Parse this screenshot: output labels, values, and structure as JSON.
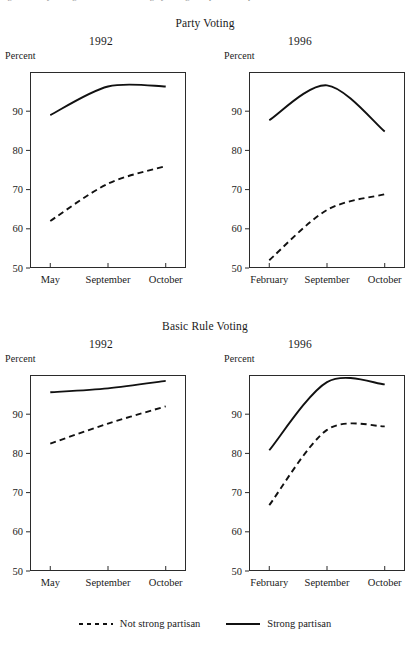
{
  "figure": {
    "caption_sliver": "Figure 1  Party voting and basic rule voting by strength of partisanship",
    "percent_axis_label": "Percent",
    "sections": [
      {
        "title": "Party Voting"
      },
      {
        "title": "Basic Rule Voting"
      }
    ]
  },
  "legend": {
    "position": "bottom-center",
    "items": [
      {
        "label": "Not strong partisan",
        "style": "dashed",
        "color": "#111111"
      },
      {
        "label": "Strong partisan",
        "style": "solid",
        "color": "#111111"
      }
    ]
  },
  "chart_data": [
    {
      "type": "line",
      "title": "Party Voting",
      "subtitle": "1992",
      "xlabel": "",
      "ylabel": "Percent",
      "categories": [
        "May",
        "September",
        "October"
      ],
      "ylim": [
        50,
        100
      ],
      "yticks": [
        50,
        60,
        70,
        80,
        90
      ],
      "grid": false,
      "legend_position": "figure-bottom",
      "series": [
        {
          "name": "Strong partisan",
          "style": "solid",
          "values": [
            89.0,
            96.3,
            96.3
          ]
        },
        {
          "name": "Not strong partisan",
          "style": "dashed",
          "values": [
            62.0,
            71.5,
            76.0
          ]
        }
      ]
    },
    {
      "type": "line",
      "title": "Party Voting",
      "subtitle": "1996",
      "xlabel": "",
      "ylabel": "Percent",
      "categories": [
        "February",
        "September",
        "October"
      ],
      "ylim": [
        50,
        100
      ],
      "yticks": [
        50,
        60,
        70,
        80,
        90
      ],
      "grid": false,
      "legend_position": "figure-bottom",
      "series": [
        {
          "name": "Strong partisan",
          "style": "solid",
          "values": [
            87.7,
            96.6,
            84.8
          ]
        },
        {
          "name": "Not strong partisan",
          "style": "dashed",
          "values": [
            52.0,
            64.8,
            68.8
          ]
        }
      ]
    },
    {
      "type": "line",
      "title": "Basic Rule Voting",
      "subtitle": "1992",
      "xlabel": "",
      "ylabel": "Percent",
      "categories": [
        "May",
        "September",
        "October"
      ],
      "ylim": [
        50,
        100
      ],
      "yticks": [
        50,
        60,
        70,
        80,
        90
      ],
      "grid": false,
      "legend_position": "figure-bottom",
      "series": [
        {
          "name": "Strong partisan",
          "style": "solid",
          "values": [
            95.6,
            96.6,
            98.5
          ]
        },
        {
          "name": "Not strong partisan",
          "style": "dashed",
          "values": [
            82.5,
            87.6,
            92.0
          ]
        }
      ]
    },
    {
      "type": "line",
      "title": "Basic Rule Voting",
      "subtitle": "1996",
      "xlabel": "",
      "ylabel": "Percent",
      "categories": [
        "February",
        "September",
        "October"
      ],
      "ylim": [
        50,
        100
      ],
      "yticks": [
        50,
        60,
        70,
        80,
        90
      ],
      "grid": false,
      "legend_position": "figure-bottom",
      "series": [
        {
          "name": "Strong partisan",
          "style": "solid",
          "values": [
            80.8,
            98.2,
            97.6
          ]
        },
        {
          "name": "Not strong partisan",
          "style": "dashed",
          "values": [
            66.8,
            86.0,
            86.9
          ]
        }
      ]
    }
  ]
}
